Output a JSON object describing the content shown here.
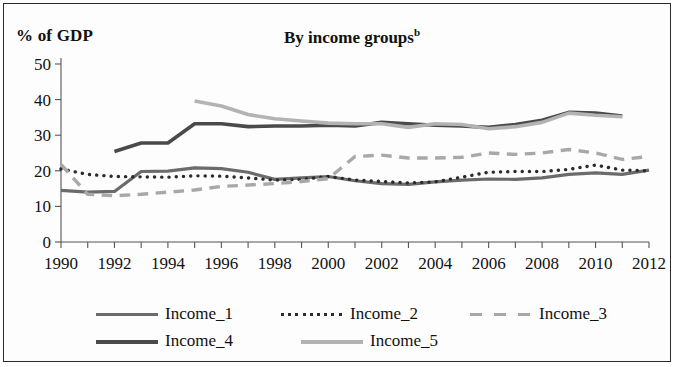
{
  "figure": {
    "ylabel": "% of GDP",
    "title": "By income groups",
    "title_superscript": "b"
  },
  "legend": {
    "row1": [
      "Income_1",
      "Income_2",
      "Income_3"
    ],
    "row2": [
      "Income_4",
      "Income_5"
    ]
  },
  "chart_data": {
    "type": "line",
    "title": "By income groups",
    "title_note": "b",
    "xlabel": "",
    "ylabel": "% of GDP",
    "xlim": [
      1990,
      2012
    ],
    "ylim": [
      0,
      50
    ],
    "yticks": [
      0,
      10,
      20,
      30,
      40,
      50
    ],
    "xticks": [
      1990,
      1991,
      1992,
      1993,
      1994,
      1995,
      1996,
      1997,
      1998,
      1999,
      2000,
      2001,
      2002,
      2003,
      2004,
      2005,
      2006,
      2007,
      2008,
      2009,
      2010,
      2011,
      2012
    ],
    "xtick_labels": [
      "1990",
      "",
      "1992",
      "",
      "1994",
      "",
      "1996",
      "",
      "1998",
      "",
      "2000",
      "",
      "2002",
      "",
      "2004",
      "",
      "2006",
      "",
      "2008",
      "",
      "2010",
      "",
      "2012"
    ],
    "grid": false,
    "legend_position": "bottom",
    "series": [
      {
        "name": "Income_1",
        "style": "solid",
        "color": "#6b6b6b",
        "width": 3.2,
        "x": [
          1990,
          1991,
          1992,
          1993,
          1994,
          1995,
          1996,
          1997,
          1998,
          1999,
          2000,
          2001,
          2002,
          2003,
          2004,
          2005,
          2006,
          2007,
          2008,
          2009,
          2010,
          2011,
          2012
        ],
        "values": [
          14.5,
          14.0,
          14.2,
          19.8,
          19.9,
          20.8,
          20.6,
          19.6,
          17.6,
          18.0,
          18.4,
          17.2,
          16.4,
          16.2,
          16.9,
          17.4,
          17.7,
          17.6,
          18.0,
          19.0,
          19.4,
          19.0,
          20.2
        ]
      },
      {
        "name": "Income_2",
        "style": "dotted",
        "color": "#2b2b2b",
        "width": 3.4,
        "x": [
          1990,
          1991,
          1992,
          1993,
          1994,
          1995,
          1996,
          1997,
          1998,
          1999,
          2000,
          2001,
          2002,
          2003,
          2004,
          2005,
          2006,
          2007,
          2008,
          2009,
          2010,
          2011,
          2012
        ],
        "values": [
          20.5,
          19.0,
          18.4,
          18.3,
          18.2,
          18.6,
          18.5,
          18.0,
          17.4,
          17.6,
          18.4,
          17.4,
          17.0,
          16.6,
          16.9,
          18.2,
          19.6,
          19.8,
          19.8,
          20.4,
          21.6,
          20.2,
          20.0
        ]
      },
      {
        "name": "Income_3",
        "style": "dashed",
        "color": "#a8a8a8",
        "width": 3.4,
        "x": [
          1990,
          1991,
          1992,
          1993,
          1994,
          1995,
          1996,
          1997,
          1998,
          1999,
          2000,
          2001,
          2002,
          2003,
          2004,
          2005,
          2006,
          2007,
          2008,
          2009,
          2010,
          2011,
          2012
        ],
        "values": [
          21.8,
          13.4,
          13.0,
          13.4,
          14.0,
          14.6,
          15.6,
          16.0,
          16.4,
          17.0,
          17.8,
          24.0,
          24.4,
          23.6,
          23.6,
          23.8,
          25.0,
          24.6,
          25.0,
          26.0,
          25.0,
          23.2,
          24.0
        ]
      },
      {
        "name": "Income_4",
        "style": "solid-dark",
        "color": "#4a4a4a",
        "width": 3.6,
        "x": [
          1992,
          1993,
          1994,
          1995,
          1996,
          1997,
          1998,
          1999,
          2000,
          2001,
          2002,
          2003,
          2004,
          2005,
          2006,
          2007,
          2008,
          2009,
          2010,
          2011
        ],
        "values": [
          25.4,
          27.8,
          27.8,
          33.2,
          33.2,
          32.4,
          32.6,
          32.6,
          32.8,
          32.6,
          33.6,
          33.2,
          32.8,
          32.6,
          32.2,
          33.0,
          34.2,
          36.4,
          36.2,
          35.4
        ]
      },
      {
        "name": "Income_5",
        "style": "solid-light",
        "color": "#b3b3b3",
        "width": 3.6,
        "x": [
          1995,
          1996,
          1997,
          1998,
          1999,
          2000,
          2001,
          2002,
          2003,
          2004,
          2005,
          2006,
          2007,
          2008,
          2009,
          2010,
          2011
        ],
        "values": [
          39.6,
          38.2,
          35.8,
          34.6,
          34.0,
          33.4,
          33.2,
          33.2,
          32.2,
          33.2,
          33.0,
          31.8,
          32.4,
          33.6,
          36.2,
          35.6,
          35.2
        ]
      }
    ]
  }
}
